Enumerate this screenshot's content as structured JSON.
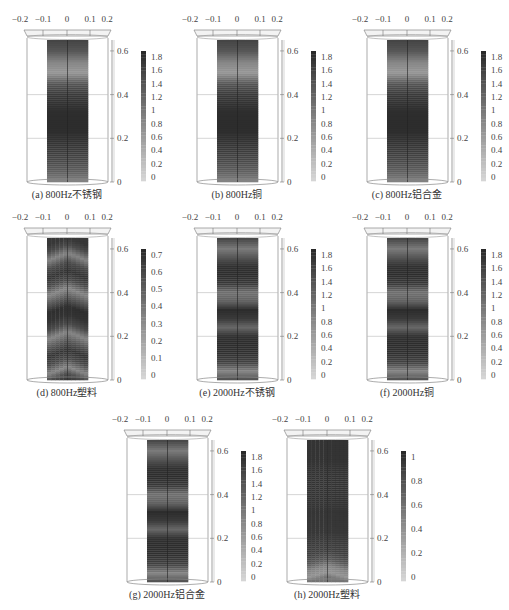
{
  "chart_data": [
    {
      "type": "heatmap",
      "id": "a",
      "title": "(a) 800Hz不锈钢",
      "x_ticks": [
        "-0.2",
        "-0.1",
        "0",
        "0.1",
        "0.2"
      ],
      "z_ticks": [
        "0",
        "0.2",
        "0.4",
        "0.6"
      ],
      "colorbar_ticks": [
        "0",
        "0.2",
        "0.4",
        "0.6",
        "0.8",
        "1",
        "1.2",
        "1.4",
        "1.6",
        "1.8"
      ],
      "colorbar_range": [
        0,
        1.9
      ],
      "x_range": [
        -0.2,
        0.2
      ],
      "z_range": [
        0,
        0.65
      ],
      "colormap": "grayscale",
      "profile_z": [
        0,
        0.05,
        0.1,
        0.15,
        0.2,
        0.25,
        0.3,
        0.35,
        0.4,
        0.45,
        0.5,
        0.55,
        0.6,
        0.65
      ],
      "profile_value": [
        0.9,
        1.3,
        1.55,
        1.7,
        1.8,
        1.85,
        1.85,
        1.8,
        1.7,
        1.4,
        0.7,
        0.9,
        1.4,
        1.6
      ],
      "pattern": "flat"
    },
    {
      "type": "heatmap",
      "id": "b",
      "title": "(b) 800Hz铜",
      "x_ticks": [
        "-0.2",
        "-0.1",
        "0",
        "0.1",
        "0.2"
      ],
      "z_ticks": [
        "0",
        "0.2",
        "0.4",
        "0.6"
      ],
      "colorbar_ticks": [
        "0",
        "0.2",
        "0.4",
        "0.6",
        "0.8",
        "1",
        "1.2",
        "1.4",
        "1.6",
        "1.8"
      ],
      "colorbar_range": [
        0,
        1.9
      ],
      "x_range": [
        -0.2,
        0.2
      ],
      "z_range": [
        0,
        0.65
      ],
      "colormap": "grayscale",
      "profile_z": [
        0,
        0.05,
        0.1,
        0.15,
        0.2,
        0.25,
        0.3,
        0.35,
        0.4,
        0.45,
        0.5,
        0.55,
        0.6,
        0.65
      ],
      "profile_value": [
        0.9,
        1.3,
        1.55,
        1.7,
        1.8,
        1.85,
        1.85,
        1.8,
        1.7,
        1.4,
        0.7,
        0.9,
        1.4,
        1.6
      ],
      "pattern": "flat"
    },
    {
      "type": "heatmap",
      "id": "c",
      "title": "(c) 800Hz铝合金",
      "x_ticks": [
        "-0.2",
        "-0.1",
        "0",
        "0.1",
        "0.2"
      ],
      "z_ticks": [
        "0",
        "0.2",
        "0.4",
        "0.6"
      ],
      "colorbar_ticks": [
        "0",
        "0.2",
        "0.4",
        "0.6",
        "0.8",
        "1",
        "1.2",
        "1.4",
        "1.6",
        "1.8"
      ],
      "colorbar_range": [
        0,
        1.9
      ],
      "x_range": [
        -0.2,
        0.2
      ],
      "z_range": [
        0,
        0.65
      ],
      "colormap": "grayscale",
      "profile_z": [
        0,
        0.05,
        0.1,
        0.15,
        0.2,
        0.25,
        0.3,
        0.35,
        0.4,
        0.45,
        0.5,
        0.55,
        0.6,
        0.65
      ],
      "profile_value": [
        0.9,
        1.3,
        1.55,
        1.7,
        1.8,
        1.85,
        1.85,
        1.8,
        1.7,
        1.4,
        0.7,
        0.9,
        1.4,
        1.6
      ],
      "pattern": "flat"
    },
    {
      "type": "heatmap",
      "id": "d",
      "title": "(d) 800Hz塑料",
      "x_ticks": [
        "-0.2",
        "-0.1",
        "0",
        "0.1",
        "0.2"
      ],
      "z_ticks": [
        "0",
        "0.2",
        "0.4",
        "0.6"
      ],
      "colorbar_ticks": [
        "0",
        "0.1",
        "0.2",
        "0.3",
        "0.4",
        "0.5",
        "0.6",
        "0.7"
      ],
      "colorbar_range": [
        0,
        0.75
      ],
      "x_range": [
        -0.2,
        0.2
      ],
      "z_range": [
        0,
        0.65
      ],
      "colormap": "grayscale",
      "profile_z": [
        0,
        0.03,
        0.06,
        0.1,
        0.14,
        0.18,
        0.22,
        0.26,
        0.3,
        0.34,
        0.38,
        0.42,
        0.46,
        0.5,
        0.54,
        0.58,
        0.62,
        0.65
      ],
      "profile_value": [
        0.7,
        0.6,
        0.35,
        0.6,
        0.7,
        0.55,
        0.35,
        0.6,
        0.7,
        0.72,
        0.55,
        0.35,
        0.6,
        0.7,
        0.6,
        0.35,
        0.6,
        0.68
      ],
      "pattern": "chevron"
    },
    {
      "type": "heatmap",
      "id": "e",
      "title": "(e) 2000Hz不锈钢",
      "x_ticks": [
        "-0.2",
        "-0.1",
        "0",
        "0.1",
        "0.2"
      ],
      "z_ticks": [
        "0",
        "0.2",
        "0.4",
        "0.6"
      ],
      "colorbar_ticks": [
        "0",
        "0.2",
        "0.4",
        "0.6",
        "0.8",
        "1",
        "1.2",
        "1.4",
        "1.6",
        "1.8"
      ],
      "colorbar_range": [
        0,
        1.9
      ],
      "x_range": [
        -0.2,
        0.2
      ],
      "z_range": [
        0,
        0.65
      ],
      "colormap": "grayscale",
      "profile_z": [
        0,
        0.04,
        0.08,
        0.12,
        0.16,
        0.2,
        0.24,
        0.28,
        0.32,
        0.36,
        0.4,
        0.44,
        0.48,
        0.52,
        0.56,
        0.6,
        0.65
      ],
      "profile_value": [
        1.5,
        0.9,
        1.6,
        1.8,
        1.85,
        1.8,
        1.2,
        1.7,
        1.85,
        1.3,
        1.1,
        1.7,
        1.85,
        1.8,
        1.4,
        1.0,
        1.6
      ],
      "pattern": "flat"
    },
    {
      "type": "heatmap",
      "id": "f",
      "title": "(f) 2000Hz铜",
      "x_ticks": [
        "-0.2",
        "-0.1",
        "0",
        "0.1",
        "0.2"
      ],
      "z_ticks": [
        "0",
        "0.2",
        "0.4",
        "0.6"
      ],
      "colorbar_ticks": [
        "0",
        "0.2",
        "0.4",
        "0.6",
        "0.8",
        "1",
        "1.2",
        "1.4",
        "1.6",
        "1.8"
      ],
      "colorbar_range": [
        0,
        1.9
      ],
      "x_range": [
        -0.2,
        0.2
      ],
      "z_range": [
        0,
        0.65
      ],
      "colormap": "grayscale",
      "profile_z": [
        0,
        0.04,
        0.08,
        0.12,
        0.16,
        0.2,
        0.24,
        0.28,
        0.32,
        0.36,
        0.4,
        0.44,
        0.48,
        0.52,
        0.56,
        0.6,
        0.65
      ],
      "profile_value": [
        1.5,
        0.9,
        1.6,
        1.8,
        1.85,
        1.8,
        1.2,
        1.7,
        1.85,
        1.3,
        1.1,
        1.7,
        1.85,
        1.8,
        1.4,
        1.0,
        1.6
      ],
      "pattern": "flat"
    },
    {
      "type": "heatmap",
      "id": "g",
      "title": "(g) 2000Hz铝合金",
      "x_ticks": [
        "-0.2",
        "-0.1",
        "0",
        "0.1",
        "0.2"
      ],
      "z_ticks": [
        "0",
        "0.2",
        "0.4",
        "0.6"
      ],
      "colorbar_ticks": [
        "0",
        "0.2",
        "0.4",
        "0.6",
        "0.8",
        "1",
        "1.2",
        "1.4",
        "1.6",
        "1.8"
      ],
      "colorbar_range": [
        0,
        1.9
      ],
      "x_range": [
        -0.2,
        0.2
      ],
      "z_range": [
        0,
        0.65
      ],
      "colormap": "grayscale",
      "profile_z": [
        0,
        0.04,
        0.08,
        0.12,
        0.16,
        0.2,
        0.24,
        0.28,
        0.32,
        0.36,
        0.4,
        0.44,
        0.48,
        0.52,
        0.56,
        0.6,
        0.65
      ],
      "profile_value": [
        1.5,
        0.9,
        1.6,
        1.8,
        1.85,
        1.8,
        1.2,
        1.7,
        1.85,
        1.3,
        1.1,
        1.7,
        1.85,
        1.8,
        1.4,
        1.0,
        1.6
      ],
      "pattern": "flat"
    },
    {
      "type": "heatmap",
      "id": "h",
      "title": "(h) 2000Hz塑料",
      "x_ticks": [
        "-0.2",
        "-0.1",
        "0",
        "0.1",
        "0.2"
      ],
      "z_ticks": [
        "0",
        "0.2",
        "0.4",
        "0.6"
      ],
      "colorbar_ticks": [
        "0",
        "0.2",
        "0.4",
        "0.6",
        "0.8",
        "1"
      ],
      "colorbar_range": [
        0,
        1.05
      ],
      "x_range": [
        -0.2,
        0.2
      ],
      "z_range": [
        0,
        0.65
      ],
      "colormap": "grayscale",
      "profile_z": [
        0,
        0.02,
        0.05,
        0.08,
        0.12,
        0.2,
        0.3,
        0.4,
        0.5,
        0.6,
        0.65
      ],
      "profile_value": [
        0.6,
        0.4,
        0.5,
        0.75,
        0.9,
        0.95,
        0.97,
        0.98,
        0.98,
        0.98,
        0.98
      ],
      "pattern": "arc-bottom"
    }
  ]
}
